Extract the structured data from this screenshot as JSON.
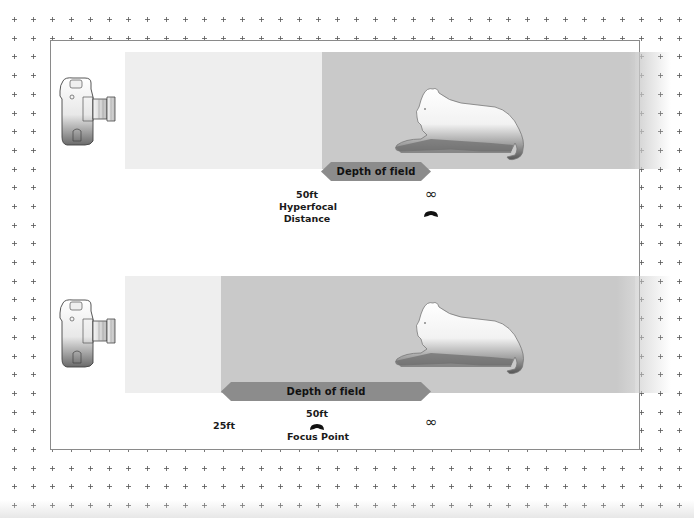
{
  "colors": {
    "background": "#ffffff",
    "grid_cross": "#555555",
    "frame_border": "#8a8a8a",
    "near_zone": "#eeeeee",
    "dof_zone": "#c9c9c9",
    "dof_arrow": "#8c8c8c",
    "text": "#1a1a1a"
  },
  "icons": {
    "camera": "camera-icon",
    "subject": "lion-icon",
    "infinity": "infinity-symbol",
    "marker": "focus-marker-icon"
  },
  "top_diagram": {
    "dof_label": "Depth of field",
    "distance_value": "50ft",
    "distance_caption_line1": "Hyperfocal",
    "distance_caption_line2": "Distance",
    "infinity_symbol": "∞"
  },
  "bottom_diagram": {
    "dof_label": "Depth of field",
    "near_limit": "25ft",
    "focus_value": "50ft",
    "focus_caption": "Focus Point",
    "infinity_symbol": "∞"
  }
}
